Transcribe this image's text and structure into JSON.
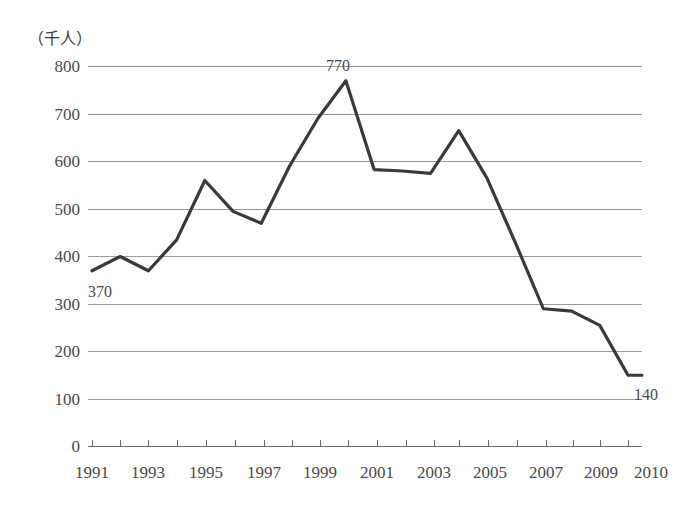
{
  "chart_data": {
    "type": "line",
    "title": "",
    "subtitle": "",
    "unit_label": "（千人）",
    "xlabel": "",
    "ylabel": "",
    "ylim": [
      0,
      800
    ],
    "ytick_step": 100,
    "yticks": [
      "800",
      "700",
      "600",
      "500",
      "400",
      "300",
      "200",
      "100",
      "0"
    ],
    "ytick_values": [
      800,
      700,
      600,
      500,
      400,
      300,
      200,
      100,
      0
    ],
    "xticks": [
      "1991",
      "1993",
      "1995",
      "1997",
      "1999",
      "2001",
      "2003",
      "2005",
      "2007",
      "2009",
      "2010"
    ],
    "xtick_values": [
      1991,
      1993,
      1995,
      1997,
      1999,
      2001,
      2003,
      2005,
      2007,
      2009,
      2010
    ],
    "x": [
      1991,
      1992,
      1993,
      1994,
      1995,
      1996,
      1997,
      1998,
      1999,
      2000,
      2001,
      2002,
      2003,
      2004,
      2005,
      2006,
      2007,
      2008,
      2009,
      2010
    ],
    "values": [
      370,
      400,
      370,
      435,
      560,
      495,
      470,
      590,
      690,
      770,
      583,
      580,
      575,
      665,
      565,
      430,
      290,
      285,
      255,
      150
    ],
    "series": [
      {
        "name": "",
        "color": "#3a3a3a",
        "values": [
          370,
          400,
          370,
          435,
          560,
          495,
          470,
          590,
          690,
          770,
          583,
          580,
          575,
          665,
          565,
          430,
          290,
          285,
          255,
          150
        ]
      }
    ],
    "annotations": [
      {
        "name": "start-value",
        "label": "370",
        "x": 1991,
        "y": 370,
        "position": "below-right"
      },
      {
        "name": "peak-value",
        "label": "770",
        "x": 2000,
        "y": 770,
        "position": "above-left"
      },
      {
        "name": "end-value",
        "label": "140",
        "x": 2010,
        "y": 150,
        "position": "right-below"
      }
    ],
    "grid": true,
    "grid_color": "#9a9a9a",
    "legend": "none",
    "line_color": "#3a3a3a",
    "background": "#ffffff"
  }
}
